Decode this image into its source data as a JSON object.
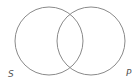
{
  "diagram": {
    "type": "venn",
    "sets": [
      {
        "label": "S",
        "cx": 49,
        "cy": 41,
        "r": 34
      },
      {
        "label": "P",
        "cx": 91,
        "cy": 41,
        "r": 34
      }
    ],
    "stroke_color": "#8a8a8a"
  }
}
